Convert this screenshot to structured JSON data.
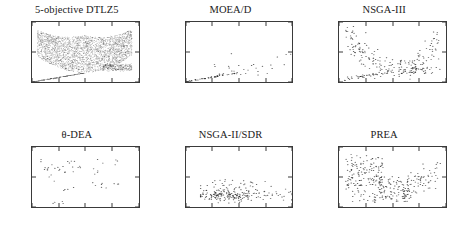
{
  "figure": {
    "rows": 2,
    "cols": 3,
    "point_color": "#2b2b2b",
    "axis_color": "#3a3a3a",
    "background": "#ffffff"
  },
  "axis": {
    "xlabel": "f",
    "xlabel_sub": "1",
    "ylabel": "f",
    "ylabel_sub": "4",
    "xticks": [
      "0",
      "0.2",
      "0.4",
      "0.6",
      "0.8"
    ],
    "yticks": [
      "0",
      "2",
      "4"
    ],
    "xlim": [
      0,
      0.8
    ],
    "ylim": [
      0,
      4
    ]
  },
  "panels": [
    {
      "id": "dtlz5-reference",
      "title": "5-objective DTLZ5"
    },
    {
      "id": "moead",
      "title": "MOEA/D"
    },
    {
      "id": "nsga3",
      "title": "NSGA-III"
    },
    {
      "id": "theta-dea",
      "title": "θ-DEA"
    },
    {
      "id": "nsga2-sdr",
      "title": "NSGA-II/SDR"
    },
    {
      "id": "prea",
      "title": "PREA"
    }
  ],
  "chart_data": [
    {
      "type": "scatter",
      "title": "5-objective DTLZ5",
      "xlabel": "f1",
      "ylabel": "f4",
      "xlim": [
        0,
        0.8
      ],
      "ylim": [
        0,
        4
      ],
      "grid": false,
      "description": "Dense reference Pareto front: wide U / parabolic band of several thousand points spanning f1 from 0.04 to 0.75 with f4 from about 0.6 up to 3.4, plus a straight diagonal line of points from the origin and a dense horizontal cluster near f4 = 1 for f1 between 0.55 and 0.75",
      "n_points": 3000,
      "seed": 11,
      "shape": "reference-band"
    },
    {
      "type": "scatter",
      "title": "MOEA/D",
      "xlabel": "f1",
      "ylabel": "f4",
      "xlim": [
        0,
        0.8
      ],
      "ylim": [
        0,
        4
      ],
      "grid": false,
      "description": "Sparse solutions hugging the lower boundary; a diagonal line of points from origin to about f1 = 0.37, then scattered points with f4 mostly between 0.4 and 1.9 across f1 up to 0.78",
      "n_points": 70,
      "seed": 23,
      "shape": "moead"
    },
    {
      "type": "scatter",
      "title": "NSGA-III",
      "xlabel": "f1",
      "ylabel": "f4",
      "xlim": [
        0,
        0.8
      ],
      "ylim": [
        0,
        4
      ],
      "grid": false,
      "description": "Clear U-shaped distribution: dense left branch rising to f4 = 3.3 near f1 = 0.05-0.3, a low valley near f1 = 0.35-0.55 with f4 about 0.6-1.0, and a right branch climbing to f4 = 3.2 near f1 = 0.7-0.75, plus a lower diagonal arc",
      "n_points": 190,
      "seed": 37,
      "shape": "ushape-sparse"
    },
    {
      "type": "scatter",
      "title": "θ-DEA",
      "xlabel": "f1",
      "ylabel": "f4",
      "xlim": [
        0,
        0.8
      ],
      "ylim": [
        0,
        4
      ],
      "grid": false,
      "description": "Very sparse set of roughly 60 clustered points, mostly with f4 between 1.2 and 3.3 and f1 between 0.05 and 0.65, with a few low points near f4 = 0.2 around f1 = 0.15-0.2",
      "n_points": 62,
      "seed": 51,
      "shape": "theta-dea"
    },
    {
      "type": "scatter",
      "title": "NSGA-II/SDR",
      "xlabel": "f1",
      "ylabel": "f4",
      "xlim": [
        0,
        0.8
      ],
      "ylim": [
        0,
        4
      ],
      "grid": false,
      "description": "Points concentrated in a low horizontal band with f4 between 0.3 and 1.9, densest around f4 = 0.7-0.9, spread across f1 from 0.12 to 0.8 with heaviest density near f1 = 0.3-0.45",
      "n_points": 230,
      "seed": 67,
      "shape": "flat-band"
    },
    {
      "type": "scatter",
      "title": "PREA",
      "xlabel": "f1",
      "ylabel": "f4",
      "xlim": [
        0,
        0.8
      ],
      "ylim": [
        0,
        4
      ],
      "grid": false,
      "description": "Dense broad U-shaped cloud covering f1 from 0.04 to 0.75 and f4 from 0.2 to 3.5, densest on the left branch around f1 = 0.1-0.3 with f4 = 1.5-3.0, thinning in the middle valley and rising again on the right",
      "n_points": 300,
      "seed": 89,
      "shape": "ushape-dense"
    }
  ]
}
